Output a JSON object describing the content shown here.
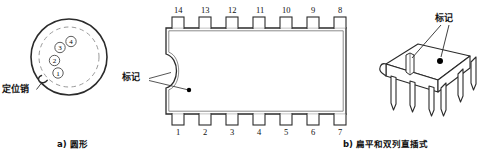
{
  "figure": {
    "title": "",
    "panels": [
      {
        "id": "panel-a",
        "caption": "a) 圆形",
        "kind": "circular-package",
        "labels": [
          {
            "name": "locating-pin",
            "text": "定位销"
          }
        ],
        "pins": [
          "①",
          "②",
          "③",
          "④"
        ],
        "pin_values": [
          1,
          2,
          3,
          4
        ]
      },
      {
        "id": "panel-b-top",
        "caption": "b) 扁平和双列直插式",
        "kind": "dip-package-top-view",
        "labels": [
          {
            "name": "marking",
            "text": "标记"
          }
        ],
        "pins_top": [
          "14",
          "13",
          "12",
          "11",
          "10",
          "9",
          "8"
        ],
        "pins_bottom": [
          "1",
          "2",
          "3",
          "4",
          "5",
          "6",
          "7"
        ]
      },
      {
        "id": "panel-b-3d",
        "kind": "dip-package-perspective",
        "labels": [
          {
            "name": "marking",
            "text": "标记"
          }
        ]
      }
    ],
    "colors": {
      "ink": "#1a1a1a",
      "line": "#2b2b2b",
      "dash": "#8a8a8a",
      "fill": "#ffffff",
      "dot": "#000000"
    }
  }
}
